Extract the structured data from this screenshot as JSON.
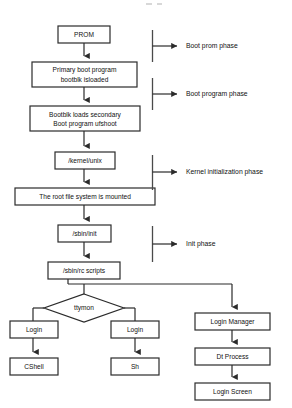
{
  "diagram": {
    "background_color": "#ffffff",
    "line_color": "#2b2b2b",
    "text_color": "#111111"
  },
  "nodes": {
    "prom": {
      "label": "PROM",
      "shape": "rect"
    },
    "primary_boot": {
      "line1": "Primary boot program",
      "line2": "bootblk isloaded",
      "shape": "rect"
    },
    "bootblk_secondary": {
      "line1_a": "Bootblk",
      "line1_b": " loads secondary",
      "line2_a": "Boot program ",
      "line2_b": "ufshoot",
      "shape": "rect"
    },
    "kernel_unix": {
      "label": "/kernel/unix",
      "shape": "rect"
    },
    "root_mounted": {
      "label": "The root file system is mounted",
      "shape": "rect"
    },
    "sbin_init": {
      "label": "/sbin/init",
      "shape": "rect"
    },
    "sbin_rc_scripts": {
      "label": "/sbin/rc scripts",
      "shape": "rect"
    },
    "ttymon": {
      "label": "ttymon",
      "shape": "diamond"
    },
    "login_left": {
      "label": "Login",
      "shape": "rect"
    },
    "login_right": {
      "label": "Login",
      "shape": "rect"
    },
    "cshell": {
      "label": "CShell",
      "shape": "rect"
    },
    "sh": {
      "label": "Sh",
      "shape": "rect"
    },
    "login_manager": {
      "label": "Login Manager",
      "shape": "rect"
    },
    "dt_process": {
      "label": "Dt Process",
      "shape": "rect"
    },
    "login_screen": {
      "label": "Login Screen",
      "shape": "rect"
    }
  },
  "phases": [
    {
      "id": "boot-prom-phase",
      "label": "Boot prom phase"
    },
    {
      "id": "boot-program-phase",
      "label": "Boot program phase"
    },
    {
      "id": "kernel-initialization-phase",
      "label": "Kernel initialization phase"
    },
    {
      "id": "init-phase",
      "label": "Init phase"
    }
  ]
}
